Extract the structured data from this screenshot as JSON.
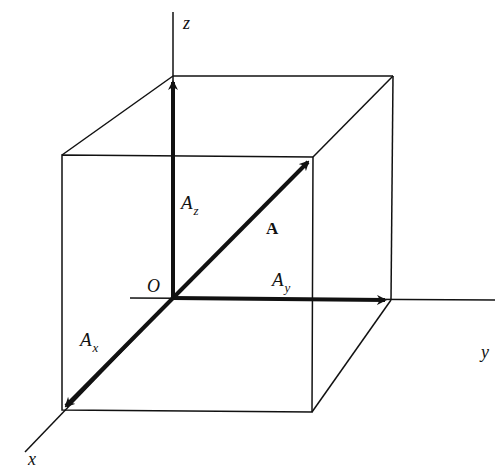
{
  "diagram": {
    "axes": {
      "x": {
        "label": "x"
      },
      "y": {
        "label": "y"
      },
      "z": {
        "label": "z"
      }
    },
    "origin": {
      "label": "O"
    },
    "vectors": {
      "A": {
        "label": "A"
      },
      "Ax": {
        "base": "A",
        "sub": "x"
      },
      "Ay": {
        "base": "A",
        "sub": "y"
      },
      "Az": {
        "base": "A",
        "sub": "z"
      }
    },
    "colors": {
      "stroke": "#111111",
      "background": "#ffffff"
    }
  }
}
